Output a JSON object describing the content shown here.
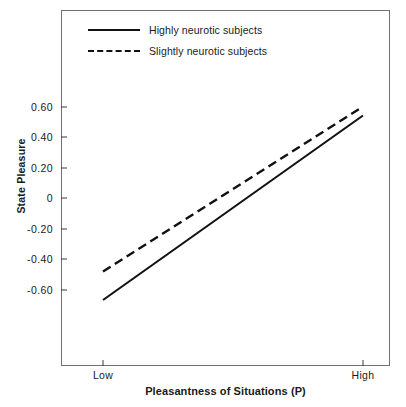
{
  "chart_data": {
    "type": "line",
    "title": "",
    "subtitle": "",
    "xlabel": "Pleasantness of Situations (P)",
    "xlabel_symbol": "P",
    "ylabel": "State Pleasure",
    "x": [
      "Low",
      "High"
    ],
    "xtick_labels": [
      "Low",
      "High"
    ],
    "ytick_labels": [
      "0.60",
      "0.40",
      "0.20",
      "0",
      "-0.20",
      "-0.40",
      "-0.60"
    ],
    "ytick_values": [
      0.6,
      0.4,
      0.2,
      0,
      -0.2,
      -0.4,
      -0.6
    ],
    "ylim": [
      -0.86,
      0.79
    ],
    "xlim": [
      0,
      1
    ],
    "grid": false,
    "legend_position": "top-left-inside",
    "series": [
      {
        "name": "Highly neurotic subjects",
        "style": "solid",
        "color": "#111111",
        "values": [
          -0.68,
          0.55
        ]
      },
      {
        "name": "Slightly neurotic subjects",
        "style": "dashed",
        "color": "#111111",
        "values": [
          -0.49,
          0.61
        ]
      }
    ]
  },
  "legend": {
    "items": [
      {
        "label": "Highly neurotic subjects",
        "style": "solid"
      },
      {
        "label": "Slightly neurotic subjects",
        "style": "dashed"
      }
    ]
  },
  "axes": {
    "y_title": "State Pleasure",
    "x_title_prefix": "Pleasantness of Situations (",
    "x_title_symbol": "P",
    "x_title_suffix": ")",
    "y_ticks": [
      {
        "label": "0.60"
      },
      {
        "label": "0.40"
      },
      {
        "label": "0.20"
      },
      {
        "label": "0"
      },
      {
        "label": "-0.20"
      },
      {
        "label": "-0.40"
      },
      {
        "label": "-0.60"
      }
    ],
    "x_ticks": [
      {
        "label": "Low"
      },
      {
        "label": "High"
      }
    ]
  },
  "colors": {
    "line": "#111111",
    "frame": "#6f6f6f",
    "background": "#ffffff",
    "text": "#1a1a1a"
  }
}
